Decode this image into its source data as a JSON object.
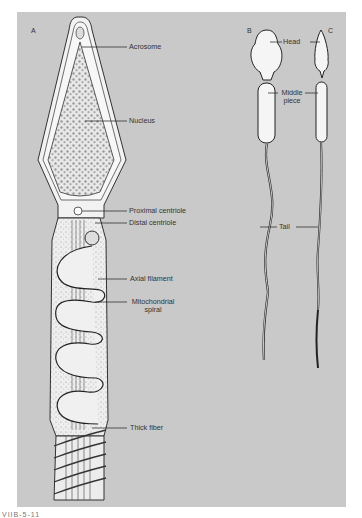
{
  "figure": {
    "panels": [
      {
        "id": "A",
        "label": "A",
        "description": "Detailed sperm cell structure"
      },
      {
        "id": "B",
        "label": "B",
        "description": "Sperm outline, wide head"
      },
      {
        "id": "C",
        "label": "C",
        "description": "Sperm outline, narrow head"
      }
    ],
    "panel_a_labels": [
      {
        "text": "Acrosome"
      },
      {
        "text": "Nucleus"
      },
      {
        "text": "Proximal centriole"
      },
      {
        "text": "Distal centriole"
      },
      {
        "text": "Axial filament"
      },
      {
        "text": "Mitochondrial spiral"
      },
      {
        "text": "Thick fiber"
      }
    ],
    "panel_bc_labels": [
      {
        "text": "Head"
      },
      {
        "text": "Middle piece"
      },
      {
        "text": "Tail"
      }
    ],
    "caption_partial": "VIIB-5-11",
    "colors": {
      "background": "#c9c9c9",
      "cell_fill": "#f4f4f4",
      "outline": "#333333",
      "label_text": "#333333"
    }
  }
}
